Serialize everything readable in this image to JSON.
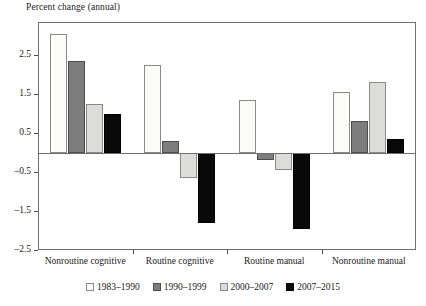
{
  "chart_data": {
    "type": "bar",
    "title": "",
    "ylabel": "Percent change (annual)",
    "xlabel": "",
    "ylim": [
      -2.5,
      3.35
    ],
    "yticks": [
      2.5,
      1.5,
      0.5,
      -0.5,
      -1.5,
      -2.5
    ],
    "ytick_labels": [
      "2.5",
      "1.5",
      "0.5",
      "–0.5",
      "–1.5",
      "–2.5"
    ],
    "grid": false,
    "legend_position": "bottom",
    "categories": [
      "Nonroutine cognitive",
      "Routine cognitive",
      "Routine manual",
      "Nonroutine manual"
    ],
    "series": [
      {
        "name": "1983–1990",
        "color": "#fbfbf8",
        "values": [
          3.05,
          2.25,
          1.35,
          1.55
        ]
      },
      {
        "name": "1990–1999",
        "color": "#7d7d7d",
        "values": [
          2.35,
          0.3,
          -0.2,
          0.8
        ]
      },
      {
        "name": "2000–2007",
        "color": "#dcdcd8",
        "values": [
          1.25,
          -0.65,
          -0.45,
          1.8
        ]
      },
      {
        "name": "2007–2015",
        "color": "#090909",
        "values": [
          1.0,
          -1.8,
          -1.95,
          0.35
        ]
      }
    ]
  },
  "axis": {
    "y_title": "Percent change (annual)"
  }
}
